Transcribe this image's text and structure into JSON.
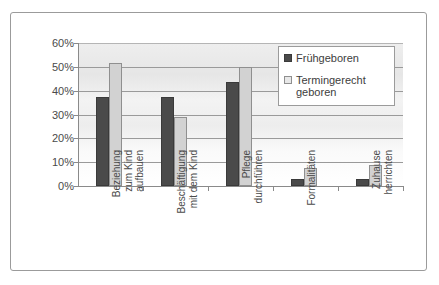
{
  "chart_data": {
    "type": "bar",
    "title": "",
    "xlabel": "",
    "ylabel": "",
    "ylim": [
      0,
      60
    ],
    "ytick_labels": [
      "60%",
      "50%",
      "40%",
      "30%",
      "20%",
      "10%",
      "0%"
    ],
    "ytick_values": [
      60,
      50,
      40,
      30,
      20,
      10,
      0
    ],
    "grid": true,
    "legend_position": "top-right",
    "categories": [
      "Beziehung\nzum Kind\naufbauen",
      "Beschäftigung\nmit dem Kind",
      "Pflege\ndurchführen",
      "Formalitäten",
      "Zuhause\nherrichten"
    ],
    "series": [
      {
        "name": "Frühgeboren",
        "color": "#4a4a4a",
        "values": [
          37.5,
          37.5,
          43.5,
          3,
          3
        ]
      },
      {
        "name": "Termingerecht\ngeboren",
        "color": "#d2d2d2",
        "values": [
          51.5,
          29,
          50,
          7.5,
          9
        ]
      }
    ]
  },
  "legend": {
    "items": [
      {
        "label": "Frühgeboren"
      },
      {
        "label": "Termingerecht\ngeboren"
      }
    ]
  }
}
